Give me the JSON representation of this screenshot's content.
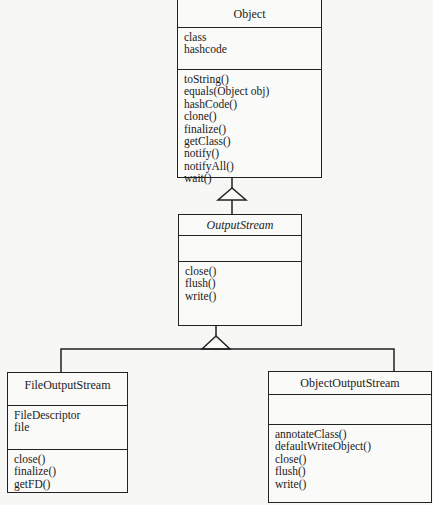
{
  "diagram": {
    "type": "UML class diagram",
    "classes": {
      "object": {
        "name": "Object",
        "abstract": false,
        "attributes": [
          "class",
          "hashcode"
        ],
        "methods": [
          "toString()",
          "equals(Object obj)",
          "hashCode()",
          "clone()",
          "finalize()",
          "getClass()",
          "notify()",
          "notifyAll()",
          "wait()"
        ]
      },
      "output_stream": {
        "name": "OutputStream",
        "abstract": true,
        "attributes": [],
        "methods": [
          "close()",
          "flush()",
          "write()"
        ]
      },
      "file_output_stream": {
        "name": "FileOutputStream",
        "abstract": false,
        "attributes": [
          "FileDescriptor",
          "file"
        ],
        "methods": [
          "close()",
          "finalize()",
          "getFD()"
        ]
      },
      "object_output_stream": {
        "name": "ObjectOutputStream",
        "abstract": false,
        "attributes": [],
        "methods": [
          "annotateClass()",
          "defaultWriteObject()",
          "close()",
          "flush()",
          "write()"
        ]
      }
    },
    "relationships": [
      {
        "type": "generalization",
        "from": "OutputStream",
        "to": "Object"
      },
      {
        "type": "generalization",
        "from": "FileOutputStream",
        "to": "OutputStream"
      },
      {
        "type": "generalization",
        "from": "ObjectOutputStream",
        "to": "OutputStream"
      }
    ],
    "colors": {
      "line": "#222222",
      "background": "#f7f7f5"
    }
  }
}
